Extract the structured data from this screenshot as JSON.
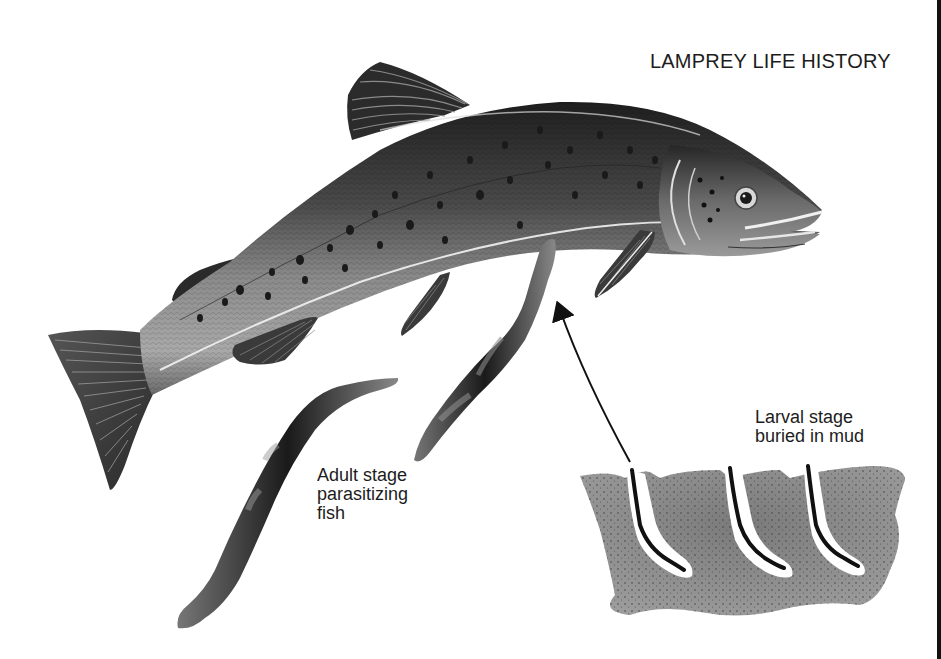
{
  "figure": {
    "title": "LAMPREY LIFE HISTORY",
    "labels": {
      "adult": [
        "Adult stage",
        "parasitizing",
        "fish"
      ],
      "larval": [
        "Larval stage",
        "buried in mud"
      ]
    },
    "elements": [
      {
        "name": "host-fish",
        "description": "trout-like host fish, spotted body"
      },
      {
        "name": "attached-lamprey",
        "description": "adult lamprey attached to fish belly"
      },
      {
        "name": "free-lamprey",
        "description": "adult lamprey swimming"
      },
      {
        "name": "mud-cross-section",
        "description": "mud with three U-shaped burrows containing larvae"
      },
      {
        "name": "lifecycle-arrow",
        "description": "curved arrow from larvae up to attached adult"
      }
    ],
    "colors": {
      "background": "#ffffff",
      "ink": "#1a1a1a",
      "fish_body": "#6e6e6e",
      "fish_dark": "#2a2a2a",
      "mud": "#8a8a8a"
    }
  }
}
